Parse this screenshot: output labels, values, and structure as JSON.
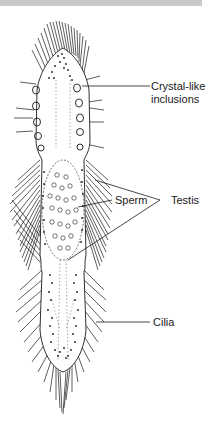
{
  "diagram": {
    "labels": {
      "crystal_line1": "Crystal-like",
      "crystal_line2": "inclusions",
      "sperm": "Sperm",
      "testis": "Testis",
      "cilia": "Cilia"
    },
    "colors": {
      "ink": "#1a1a1a",
      "body_fill": "#ffffff",
      "banner": "#c9c9c9"
    }
  }
}
